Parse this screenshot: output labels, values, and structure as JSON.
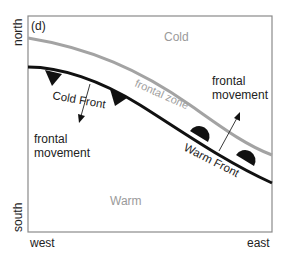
{
  "panel_label": "(d)",
  "axes": {
    "y_top": "north",
    "y_bottom": "south",
    "x_left": "west",
    "x_right": "east"
  },
  "regions": {
    "cold": "Cold",
    "warm": "Warm"
  },
  "fronts": {
    "cold_front": "Cold Front",
    "warm_front": "Warm Front",
    "frontal_zone": "frontal zone"
  },
  "movement_labels": {
    "left_line1": "frontal",
    "left_line2": "movement",
    "right_line1": "frontal",
    "right_line2": "movement"
  },
  "colors": {
    "front_line": "#111111",
    "frontal_zone_line": "#a0a0a0",
    "region_text": "#9a9a9a",
    "frame": "#888888"
  }
}
